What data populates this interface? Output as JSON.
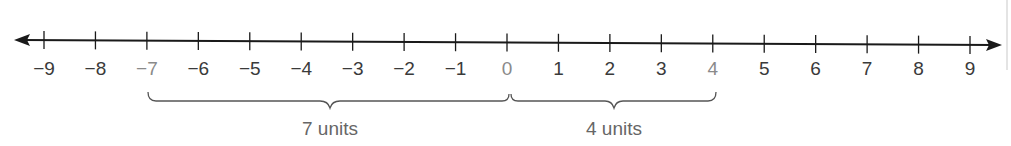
{
  "diagram": {
    "type": "number-line",
    "range": [
      -9,
      9
    ],
    "ticks": [
      -9,
      -8,
      -7,
      -6,
      -5,
      -4,
      -3,
      -2,
      -1,
      0,
      1,
      2,
      3,
      4,
      5,
      6,
      7,
      8,
      9
    ],
    "tick_labels": [
      "−9",
      "−8",
      "−7",
      "−6",
      "−5",
      "−4",
      "−3",
      "−2",
      "−1",
      "0",
      "1",
      "2",
      "3",
      "4",
      "5",
      "6",
      "7",
      "8",
      "9"
    ],
    "highlighted_ticks": [
      "−7",
      "0",
      "4"
    ],
    "braces": [
      {
        "from": -7,
        "to": 0,
        "label": "7 units"
      },
      {
        "from": 0,
        "to": 4,
        "label": "4 units"
      }
    ],
    "colors": {
      "line": "#1a1a1a",
      "label": "#3a3a3a",
      "highlight_label": "#8a8a8a",
      "brace": "#555555",
      "brace_label": "#666666"
    }
  }
}
